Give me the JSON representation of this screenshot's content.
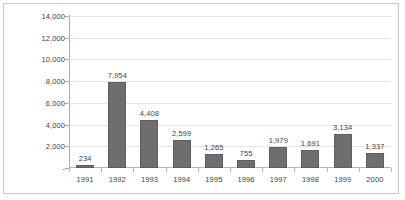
{
  "chart_data": {
    "type": "bar",
    "title": "",
    "xlabel": "",
    "ylabel": "",
    "categories": [
      "1991",
      "1992",
      "1993",
      "1994",
      "1995",
      "1996",
      "1997",
      "1998",
      "1999",
      "2000"
    ],
    "values": [
      234,
      7954,
      4408,
      2599,
      1265,
      755,
      1979,
      1691,
      3134,
      1337
    ],
    "value_labels": [
      "234",
      "7,954",
      "4,408",
      "2,599",
      "1,265",
      "755",
      "1,979",
      "1,691",
      "3,134",
      "1,337"
    ],
    "ylim": [
      0,
      14000
    ],
    "ytick_values": [
      0,
      2000,
      4000,
      6000,
      8000,
      10000,
      12000,
      14000
    ],
    "ytick_labels": [
      "-",
      "2,000",
      "4,000",
      "6,000",
      "8,000",
      "10,000",
      "12,000",
      "14,000"
    ],
    "grid": true,
    "legend": false,
    "bar_color": "#6e6e6e",
    "bar_edge_color": "#5e5e5e",
    "gridline_color": "#e3e3e3",
    "axis_color": "#a8a8a8",
    "text_color": "#3f3f3f",
    "plot_background": "#ffffff",
    "border_color": "#c9c9c9"
  }
}
